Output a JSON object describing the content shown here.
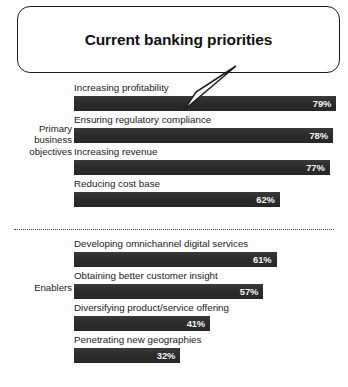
{
  "callout": {
    "title": "Current banking priorities",
    "tail_icon": "callout-tail-pointer"
  },
  "groups": [
    {
      "id": "primary-business-objectives",
      "label": "Primary\nbusiness\nobjectives",
      "label_lines": [
        "Primary",
        "business",
        "objectives"
      ],
      "rows": [
        {
          "label": "Increasing profitability",
          "value": 79,
          "value_text": "79%"
        },
        {
          "label": "Ensuring regulatory compliance",
          "value": 78,
          "value_text": "78%"
        },
        {
          "label": "Increasing revenue",
          "value": 77,
          "value_text": "77%"
        },
        {
          "label": "Reducing cost base",
          "value": 62,
          "value_text": "62%"
        }
      ]
    },
    {
      "id": "enablers",
      "label": "Enablers",
      "label_lines": [
        "Enablers"
      ],
      "rows": [
        {
          "label": "Developing omnichannel digital services",
          "value": 61,
          "value_text": "61%"
        },
        {
          "label": "Obtaining better customer insight",
          "value": 57,
          "value_text": "57%"
        },
        {
          "label": "Diversifying product/service offering",
          "value": 41,
          "value_text": "41%"
        },
        {
          "label": "Penetrating new geographies",
          "value": 32,
          "value_text": "32%"
        }
      ]
    }
  ],
  "style": {
    "bar_color": "#2d2d2d",
    "bar_value_color": "#f4f4f4",
    "text_color": "#1c1c1c",
    "outline_color": "#1b1b1b",
    "divider_color": "#4a4a4a",
    "background": "#fdfdfd"
  },
  "chart_data": {
    "type": "bar",
    "orientation": "horizontal",
    "title": "Current banking priorities",
    "xlabel": "",
    "ylabel": "",
    "xlim": [
      0,
      100
    ],
    "grid": false,
    "legend": "none",
    "value_labels": true,
    "value_suffix": "%",
    "groups": [
      "Primary business objectives",
      "Enablers"
    ],
    "categories": [
      "Increasing profitability",
      "Ensuring regulatory compliance",
      "Increasing revenue",
      "Reducing cost base",
      "Developing omnichannel digital services",
      "Obtaining better customer insight",
      "Diversifying product/service offering",
      "Penetrating new geographies"
    ],
    "values": [
      79,
      78,
      77,
      62,
      61,
      57,
      41,
      32
    ],
    "series": [
      {
        "name": "Share of respondents",
        "values": [
          79,
          78,
          77,
          62,
          61,
          57,
          41,
          32
        ]
      }
    ],
    "group_membership": [
      "Primary business objectives",
      "Primary business objectives",
      "Primary business objectives",
      "Primary business objectives",
      "Enablers",
      "Enablers",
      "Enablers",
      "Enablers"
    ],
    "annotations": [
      "Current banking priorities callout points to the top bar (79%)"
    ]
  }
}
